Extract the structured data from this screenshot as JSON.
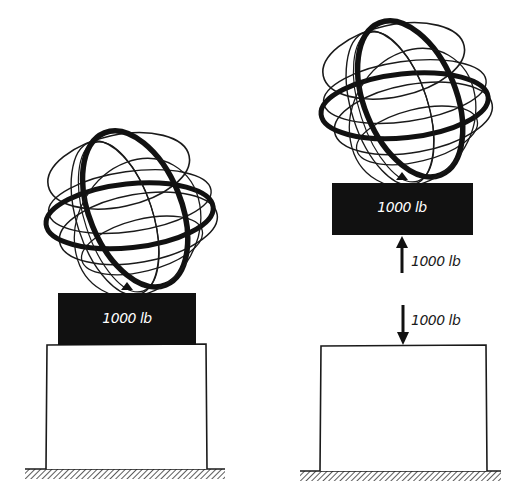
{
  "figure": {
    "left_scene": {
      "block_label": "1000 lb"
    },
    "right_scene": {
      "block_label": "1000 lb",
      "upward_force_label": "1000 lb",
      "downward_force_label": "1000 lb"
    }
  },
  "colors": {
    "ink": "#1a1a1a",
    "block_fill": "#111111",
    "background": "#ffffff"
  }
}
